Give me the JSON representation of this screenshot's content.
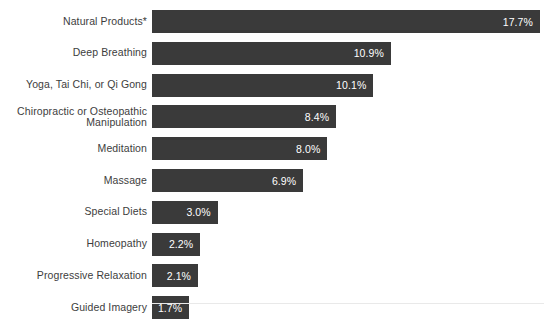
{
  "chart_data": {
    "type": "bar",
    "orientation": "horizontal",
    "title": "",
    "subtitle": "",
    "xlabel": "",
    "ylabel": "",
    "xlim": [
      0,
      17.7
    ],
    "grid": false,
    "legend": false,
    "value_suffix": "%",
    "bar_color": "#3a3a3a",
    "label_color": "#3d3d3d",
    "value_label_color": "#ffffff",
    "background_color": "#ffffff",
    "categories": [
      "Natural Products*",
      "Deep Breathing",
      "Yoga, Tai Chi, or Qi Gong",
      "Chiropractic or Osteopathic\nManipulation",
      "Meditation",
      "Massage",
      "Special Diets",
      "Homeopathy",
      "Progressive Relaxation",
      "Guided Imagery"
    ],
    "values": [
      17.7,
      10.9,
      10.1,
      8.4,
      8.0,
      6.9,
      3.0,
      2.2,
      2.1,
      1.7
    ],
    "value_labels": [
      "17.7%",
      "10.9%",
      "10.1%",
      "8.4%",
      "8.0%",
      "6.9%",
      "3.0%",
      "2.2%",
      "2.1%",
      "1.7%"
    ],
    "bars": [
      {
        "category": "Natural Products*",
        "value": 17.7,
        "label": "17.7%",
        "multiline": false
      },
      {
        "category": "Deep Breathing",
        "value": 10.9,
        "label": "10.9%",
        "multiline": false
      },
      {
        "category": "Yoga, Tai Chi, or Qi Gong",
        "value": 10.1,
        "label": "10.1%",
        "multiline": false
      },
      {
        "category": "Chiropractic or Osteopathic\nManipulation",
        "value": 8.4,
        "label": "8.4%",
        "multiline": true
      },
      {
        "category": "Meditation",
        "value": 8.0,
        "label": "8.0%",
        "multiline": false
      },
      {
        "category": "Massage",
        "value": 6.9,
        "label": "6.9%",
        "multiline": false
      },
      {
        "category": "Special Diets",
        "value": 3.0,
        "label": "3.0%",
        "multiline": false
      },
      {
        "category": "Homeopathy",
        "value": 2.2,
        "label": "2.2%",
        "multiline": false
      },
      {
        "category": "Progressive Relaxation",
        "value": 2.1,
        "label": "2.1%",
        "multiline": false
      },
      {
        "category": "Guided Imagery",
        "value": 1.7,
        "label": "1.7%",
        "multiline": false
      }
    ]
  },
  "layout": {
    "bar_origin_x": 152,
    "first_bar_top": 10,
    "row_pitch": 31.8,
    "bar_height": 23,
    "px_per_unit": 21.92,
    "label_right_edge": 147,
    "axis_line_y": 303
  }
}
